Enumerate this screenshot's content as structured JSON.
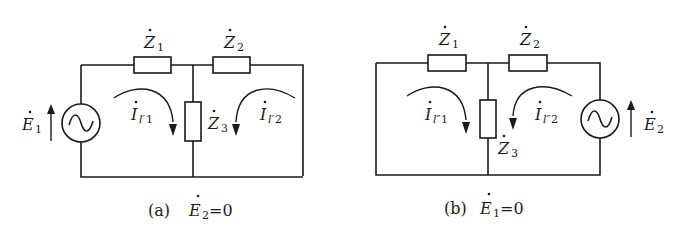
{
  "circuit_a": {
    "caption_prefix": "(a)",
    "caption_var": "E",
    "caption_sub": "2",
    "caption_suffix": "=0",
    "impedances": [
      {
        "name": "Z",
        "sub": "1"
      },
      {
        "name": "Z",
        "sub": "2"
      },
      {
        "name": "Z",
        "sub": "3"
      }
    ],
    "source": {
      "name": "E",
      "sub": "1",
      "symbol": "~"
    },
    "currents": [
      {
        "name": "I",
        "sub_var": "l′",
        "sub_num": "1"
      },
      {
        "name": "I",
        "sub_var": "l′",
        "sub_num": "2"
      }
    ]
  },
  "circuit_b": {
    "caption_prefix": "(b)",
    "caption_var": "E",
    "caption_sub": "1",
    "caption_suffix": "=0",
    "impedances": [
      {
        "name": "Z",
        "sub": "1"
      },
      {
        "name": "Z",
        "sub": "2"
      },
      {
        "name": "Z",
        "sub": "3"
      }
    ],
    "source": {
      "name": "E",
      "sub": "2",
      "symbol": "~"
    },
    "currents": [
      {
        "name": "I",
        "sub_var": "l″",
        "sub_num": "1"
      },
      {
        "name": "I",
        "sub_var": "l″",
        "sub_num": "2"
      }
    ]
  }
}
